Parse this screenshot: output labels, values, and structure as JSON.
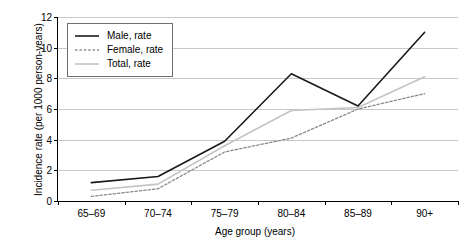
{
  "chart_data": {
    "type": "line",
    "title": "",
    "xlabel": "Age group (years)",
    "ylabel": "Incidence rate (per 1000 person-years)",
    "categories": [
      "65–69",
      "70–74",
      "75–79",
      "80–84",
      "85–89",
      "90+"
    ],
    "ylim": [
      0,
      12
    ],
    "yticks": [
      0,
      2,
      4,
      6,
      8,
      10,
      12
    ],
    "ytick_labels": [
      "0",
      "2",
      "4",
      "6",
      "8",
      "10",
      "12"
    ],
    "grid": "horizontal",
    "legend_position": "top-left",
    "series": [
      {
        "name": "Male, rate",
        "values": [
          1.2,
          1.6,
          3.9,
          8.3,
          6.2,
          11.0
        ],
        "color": "#1a1a1a",
        "style": "solid",
        "width": 1.6
      },
      {
        "name": "Female, rate",
        "values": [
          0.3,
          0.8,
          3.2,
          4.1,
          6.0,
          7.0
        ],
        "color": "#8a8a8a",
        "style": "dotted",
        "width": 1.3
      },
      {
        "name": "Total, rate",
        "values": [
          0.7,
          1.1,
          3.6,
          5.9,
          6.1,
          8.1
        ],
        "color": "#c4c4c4",
        "style": "solid",
        "width": 1.6
      }
    ]
  },
  "legend": {
    "items": [
      {
        "label": "Male, rate"
      },
      {
        "label": "Female, rate"
      },
      {
        "label": "Total, rate"
      }
    ]
  },
  "axes": {
    "y_title": "Incidence rate (per 1000 person-years)",
    "x_title": "Age group (years)"
  }
}
